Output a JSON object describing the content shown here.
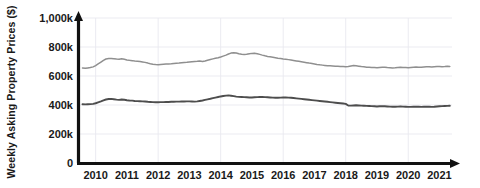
{
  "chart_data": {
    "type": "line",
    "title": "",
    "xlabel": "",
    "ylabel": "Weekly Asking Property Prices ($)",
    "grid": true,
    "legend": "none",
    "xlim": [
      2009.5,
      2021.4
    ],
    "ylim": [
      0,
      1000000
    ],
    "x_tick_labels": [
      "2010",
      "2011",
      "2012",
      "2013",
      "2014",
      "2015",
      "2016",
      "2017",
      "2018",
      "2019",
      "2020",
      "2021"
    ],
    "x_tick_values": [
      2010,
      2011,
      2012,
      2013,
      2014,
      2015,
      2016,
      2017,
      2018,
      2019,
      2020,
      2021
    ],
    "y_tick_labels": [
      "0",
      "200k",
      "400k",
      "600k",
      "800k",
      "1,000k"
    ],
    "y_tick_values": [
      0,
      200000,
      400000,
      600000,
      800000,
      1000000
    ],
    "series": [
      {
        "name": "upper-series",
        "color": "#8f8f8f",
        "stroke_width": 1.5,
        "x": [
          2009.58,
          2009.67,
          2009.75,
          2009.83,
          2009.92,
          2010.0,
          2010.08,
          2010.17,
          2010.25,
          2010.33,
          2010.42,
          2010.5,
          2010.58,
          2010.67,
          2010.75,
          2010.83,
          2010.92,
          2011.0,
          2011.08,
          2011.17,
          2011.25,
          2011.33,
          2011.42,
          2011.5,
          2011.58,
          2011.67,
          2011.75,
          2011.83,
          2011.92,
          2012.0,
          2012.08,
          2012.17,
          2012.25,
          2012.33,
          2012.42,
          2012.5,
          2012.58,
          2012.67,
          2012.75,
          2012.83,
          2012.92,
          2013.0,
          2013.08,
          2013.17,
          2013.25,
          2013.33,
          2013.42,
          2013.5,
          2013.58,
          2013.67,
          2013.75,
          2013.83,
          2013.92,
          2014.0,
          2014.08,
          2014.17,
          2014.25,
          2014.33,
          2014.42,
          2014.5,
          2014.58,
          2014.67,
          2014.75,
          2014.83,
          2014.92,
          2015.0,
          2015.08,
          2015.17,
          2015.25,
          2015.33,
          2015.42,
          2015.5,
          2015.58,
          2015.67,
          2015.75,
          2015.83,
          2015.92,
          2016.0,
          2016.08,
          2016.17,
          2016.25,
          2016.33,
          2016.42,
          2016.5,
          2016.58,
          2016.67,
          2016.75,
          2016.83,
          2016.92,
          2017.0,
          2017.08,
          2017.17,
          2017.25,
          2017.33,
          2017.42,
          2017.5,
          2017.58,
          2017.67,
          2017.75,
          2017.83,
          2017.92,
          2018.0,
          2018.08,
          2018.17,
          2018.25,
          2018.33,
          2018.42,
          2018.5,
          2018.58,
          2018.67,
          2018.75,
          2018.83,
          2018.92,
          2019.0,
          2019.08,
          2019.17,
          2019.25,
          2019.33,
          2019.42,
          2019.5,
          2019.58,
          2019.67,
          2019.75,
          2019.83,
          2019.92,
          2020.0,
          2020.08,
          2020.17,
          2020.25,
          2020.33,
          2020.42,
          2020.5,
          2020.58,
          2020.67,
          2020.75,
          2020.83,
          2020.92,
          2021.0,
          2021.08,
          2021.17,
          2021.25,
          2021.33
        ],
        "values": [
          655000,
          654000,
          656000,
          658000,
          663000,
          672000,
          683000,
          696000,
          708000,
          717000,
          720000,
          721000,
          719000,
          717000,
          716000,
          719000,
          715000,
          711000,
          708000,
          706000,
          703000,
          702000,
          700000,
          697000,
          694000,
          689000,
          684000,
          681000,
          679000,
          678000,
          680000,
          681000,
          682000,
          683000,
          684000,
          686000,
          688000,
          689000,
          691000,
          693000,
          694000,
          696000,
          698000,
          700000,
          701000,
          703000,
          700000,
          704000,
          709000,
          714000,
          718000,
          722000,
          726000,
          731000,
          737000,
          744000,
          752000,
          758000,
          761000,
          759000,
          754000,
          750000,
          748000,
          750000,
          753000,
          756000,
          757000,
          754000,
          749000,
          744000,
          739000,
          735000,
          732000,
          729000,
          726000,
          723000,
          721000,
          718000,
          716000,
          713000,
          710000,
          707000,
          704000,
          701000,
          698000,
          695000,
          692000,
          689000,
          686000,
          683000,
          680000,
          677000,
          675000,
          673000,
          671000,
          670000,
          669000,
          668000,
          667000,
          666000,
          665000,
          664000,
          666000,
          669000,
          672000,
          671000,
          668000,
          665000,
          663000,
          661000,
          660000,
          659000,
          658000,
          657000,
          659000,
          661000,
          660000,
          658000,
          657000,
          656000,
          657000,
          659000,
          660000,
          659000,
          658000,
          657000,
          659000,
          661000,
          662000,
          661000,
          660000,
          662000,
          664000,
          663000,
          662000,
          664000,
          666000,
          665000,
          664000,
          665000,
          667000,
          666000
        ],
        "start_value": 655000,
        "peak_value": 761000,
        "peak_year": 2014.42,
        "end_value": 666000
      },
      {
        "name": "lower-series",
        "color": "#4d4d4d",
        "stroke_width": 1.9,
        "x": [
          2009.58,
          2009.67,
          2009.75,
          2009.83,
          2009.92,
          2010.0,
          2010.08,
          2010.17,
          2010.25,
          2010.33,
          2010.42,
          2010.5,
          2010.58,
          2010.67,
          2010.75,
          2010.83,
          2010.92,
          2011.0,
          2011.08,
          2011.17,
          2011.25,
          2011.33,
          2011.42,
          2011.5,
          2011.58,
          2011.67,
          2011.75,
          2011.83,
          2011.92,
          2012.0,
          2012.08,
          2012.17,
          2012.25,
          2012.33,
          2012.42,
          2012.5,
          2012.58,
          2012.67,
          2012.75,
          2012.83,
          2012.92,
          2013.0,
          2013.08,
          2013.17,
          2013.25,
          2013.33,
          2013.42,
          2013.5,
          2013.58,
          2013.67,
          2013.75,
          2013.83,
          2013.92,
          2014.0,
          2014.08,
          2014.17,
          2014.25,
          2014.33,
          2014.42,
          2014.5,
          2014.58,
          2014.67,
          2014.75,
          2014.83,
          2014.92,
          2015.0,
          2015.08,
          2015.17,
          2015.25,
          2015.33,
          2015.42,
          2015.5,
          2015.58,
          2015.67,
          2015.75,
          2015.83,
          2015.92,
          2016.0,
          2016.08,
          2016.17,
          2016.25,
          2016.33,
          2016.42,
          2016.5,
          2016.58,
          2016.67,
          2016.75,
          2016.83,
          2016.92,
          2017.0,
          2017.08,
          2017.17,
          2017.25,
          2017.33,
          2017.42,
          2017.5,
          2017.58,
          2017.67,
          2017.75,
          2017.83,
          2017.92,
          2018.0,
          2018.08,
          2018.17,
          2018.25,
          2018.33,
          2018.42,
          2018.5,
          2018.58,
          2018.67,
          2018.75,
          2018.83,
          2018.92,
          2019.0,
          2019.08,
          2019.17,
          2019.25,
          2019.33,
          2019.42,
          2019.5,
          2019.58,
          2019.67,
          2019.75,
          2019.83,
          2019.92,
          2020.0,
          2020.08,
          2020.17,
          2020.25,
          2020.33,
          2020.42,
          2020.5,
          2020.58,
          2020.67,
          2020.75,
          2020.83,
          2020.92,
          2021.0,
          2021.08,
          2021.17,
          2021.25,
          2021.33
        ],
        "values": [
          405000,
          404000,
          405000,
          406000,
          408000,
          412000,
          418000,
          425000,
          432000,
          438000,
          441000,
          442000,
          440000,
          437000,
          435000,
          438000,
          436000,
          433000,
          431000,
          430000,
          428000,
          427000,
          426000,
          425000,
          424000,
          422000,
          421000,
          420000,
          419000,
          419000,
          420000,
          420000,
          421000,
          421000,
          422000,
          422000,
          423000,
          423000,
          424000,
          424000,
          425000,
          425000,
          424000,
          423000,
          425000,
          428000,
          431000,
          435000,
          439000,
          443000,
          447000,
          451000,
          455000,
          459000,
          462000,
          465000,
          466000,
          464000,
          461000,
          458000,
          456000,
          455000,
          454000,
          453000,
          452000,
          452000,
          453000,
          454000,
          455000,
          455000,
          454000,
          453000,
          452000,
          451000,
          450000,
          450000,
          451000,
          452000,
          452000,
          451000,
          450000,
          448000,
          446000,
          444000,
          442000,
          440000,
          438000,
          436000,
          434000,
          432000,
          430000,
          428000,
          426000,
          424000,
          422000,
          420000,
          418000,
          416000,
          414000,
          412000,
          410000,
          408000,
          397000,
          396000,
          397000,
          398000,
          397000,
          396000,
          395000,
          394000,
          393000,
          392000,
          391000,
          390000,
          391000,
          392000,
          391000,
          390000,
          389000,
          388000,
          388000,
          389000,
          390000,
          389000,
          388000,
          387000,
          387000,
          388000,
          389000,
          388000,
          387000,
          388000,
          389000,
          388000,
          387000,
          388000,
          390000,
          391000,
          392000,
          393000,
          394000,
          395000
        ],
        "start_value": 405000,
        "peak_value": 466000,
        "peak_year": 2014.25,
        "end_value": 395000
      }
    ]
  },
  "axes": {
    "y_arrow": true,
    "x_arrow": true,
    "axis_color": "#111111",
    "grid_color": "#e9e9ef"
  }
}
